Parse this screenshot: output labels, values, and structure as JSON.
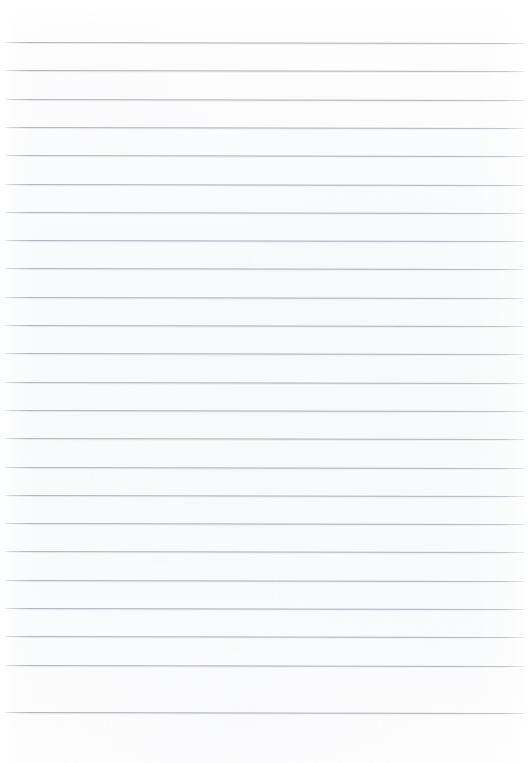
{
  "page": {
    "kind": "scanned-blank-lined-notebook-page",
    "width_px": 528,
    "height_px": 763,
    "background_color": "#fbfbfc",
    "has_text_content": false,
    "text_content": "",
    "orientation": "portrait"
  },
  "ruling": {
    "line_color": "#a8acb3",
    "line_thickness_px": 1,
    "line_count": 24,
    "first_line_y_px": 42,
    "line_spacing_px": 28.3,
    "left_inset_px": 3,
    "right_inset_px": 4,
    "slant_deg": 0.12,
    "style": "wide-ruled-horizontal",
    "has_vertical_margin_rule": false,
    "lines_y_px": [
      42,
      70.3,
      98.6,
      126.9,
      155.2,
      183.5,
      211.8,
      240.1,
      268.4,
      296.7,
      325.0,
      353.3,
      381.6,
      409.9,
      438.2,
      466.5,
      494.8,
      523.1,
      551.4,
      579.7,
      608.0,
      636.3,
      664.6,
      712.0
    ]
  },
  "margins": {
    "top_blank_height_px": 42,
    "bottom_blank_height_px": 51,
    "left_light_band_width_px": 8
  }
}
